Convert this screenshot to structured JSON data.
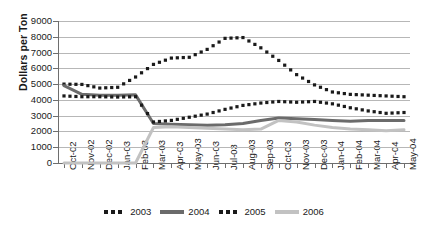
{
  "chart": {
    "ylabel": "Dollars per Ton",
    "xlabel": ""
  },
  "chart_data": {
    "type": "line",
    "title": "",
    "xlabel": "",
    "ylabel": "Dollars per Ton",
    "ylim": [
      0,
      9000
    ],
    "ytick_step": 1000,
    "yticks": [
      "0",
      "1000",
      "2000",
      "3000",
      "4000",
      "5000",
      "6000",
      "7000",
      "8000",
      "9000"
    ],
    "grid": true,
    "legend_position": "bottom-center",
    "categories": [
      "Oct-02",
      "Nov-02",
      "Dec-02",
      "Jan-03",
      "Feb-03",
      "Mar-03",
      "Apr-03",
      "May-03",
      "Jun-03",
      "Jul-03",
      "Aug-03",
      "Sep-03",
      "Oct-03",
      "Nov-03",
      "Dec-03",
      "Jan-04",
      "Feb-04",
      "Mar-04",
      "Apr-04",
      "May-04"
    ],
    "series": [
      {
        "name": "2003",
        "style": "dotted",
        "color": "#1a1a1a",
        "values": [
          5000,
          4980,
          4750,
          4800,
          5450,
          6250,
          6650,
          6700,
          7200,
          7900,
          7950,
          7300,
          6500,
          5600,
          4950,
          4500,
          4350,
          4300,
          4250,
          4200
        ]
      },
      {
        "name": "2004",
        "style": "solid",
        "color": "#6b6b6b",
        "values": [
          4900,
          4350,
          4300,
          4300,
          4320,
          4400,
          4700,
          5100,
          4750,
          4700,
          4850,
          4880,
          4600,
          4250,
          3400,
          2800,
          2550,
          2500,
          2480,
          2500
        ]
      },
      {
        "name": "2005",
        "style": "dotted",
        "color": "#1a1a1a",
        "values": [
          4250,
          4200,
          4200,
          4180,
          4200,
          4250,
          4600,
          5050,
          4700,
          4650,
          4800,
          4850,
          4600,
          4200,
          3400,
          2850,
          2600,
          2520,
          2500,
          2520
        ]
      },
      {
        "name": "2006",
        "style": "solid",
        "color": "#c2c2c2",
        "values": [
          0,
          0,
          0,
          0,
          0,
          0,
          0,
          0,
          0,
          1100,
          2200,
          2250,
          2250,
          2300,
          2200,
          2050,
          2100,
          2350,
          2400,
          2450
        ]
      }
    ],
    "series_continuation": {
      "note": "Series extend across full 20-month axis; 2005 dotted rises again after Aug-03 to ~3900 by Jan-04 then falls to ~3200 at May-04; 2004 solid recovers to ~2850 by Feb-04 then ~2700 at May-04; 2006 light line ends ~2100.",
      "2005_tail": [
        2600,
        2700,
        2900,
        3100,
        3400,
        3650,
        3800,
        3900,
        3850,
        3900,
        3750,
        3500,
        3300,
        3150,
        3200
      ],
      "2004_tail": [
        2500,
        2450,
        2420,
        2400,
        2420,
        2500,
        2700,
        2850,
        2800,
        2750,
        2700,
        2650,
        2700,
        2700,
        2700
      ],
      "2006_tail": [
        2250,
        2300,
        2250,
        2200,
        2150,
        2100,
        2150,
        2700,
        2600,
        2400,
        2250,
        2150,
        2100,
        2050,
        2100
      ]
    }
  },
  "legend": {
    "items": [
      {
        "label": "2003",
        "swatch": "dotted-dark"
      },
      {
        "label": "2004",
        "swatch": "solid-dark"
      },
      {
        "label": "2005",
        "swatch": "dotted-dark"
      },
      {
        "label": "2006",
        "swatch": "solid-light"
      }
    ]
  },
  "colors": {
    "dark": "#1a1a1a",
    "mid_gray": "#6b6b6b",
    "light_gray": "#c2c2c2",
    "gridline": "#b7b7b7",
    "axis": "#6e6e6e",
    "background": "#ffffff"
  }
}
